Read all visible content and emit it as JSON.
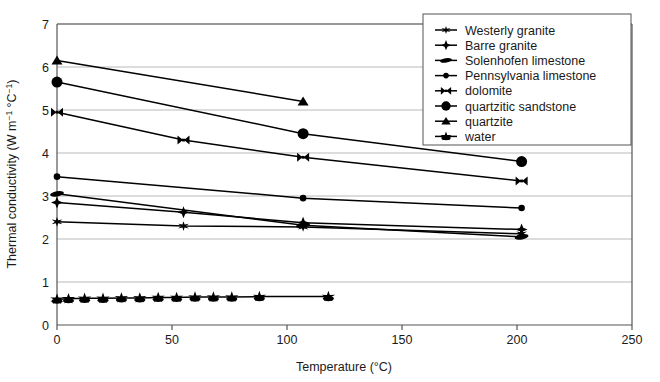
{
  "chart_data": {
    "type": "line",
    "title": "",
    "xlabel": "Temperature (°C)",
    "ylabel": "Thermal conductivity (W m⁻¹ °C⁻¹)",
    "xlim": [
      0,
      250
    ],
    "ylim": [
      0,
      7
    ],
    "xticks": [
      0,
      50,
      100,
      150,
      200,
      250
    ],
    "yticks": [
      0,
      1,
      2,
      3,
      4,
      5,
      6,
      7
    ],
    "grid": "horizontal",
    "legend_position": "top-right",
    "series": [
      {
        "name": "Westerly granite",
        "marker": "star6",
        "color": "#000000",
        "points": [
          [
            0,
            2.4
          ],
          [
            55,
            2.3
          ],
          [
            107,
            2.28
          ],
          [
            202,
            2.12
          ]
        ]
      },
      {
        "name": "Barre granite",
        "marker": "plus-star",
        "color": "#000000",
        "points": [
          [
            0,
            2.85
          ],
          [
            55,
            2.62
          ],
          [
            107,
            2.38
          ],
          [
            202,
            2.22
          ]
        ]
      },
      {
        "name": "Solenhofen limestone",
        "marker": "flat-ellipse",
        "color": "#000000",
        "points": [
          [
            0,
            3.05
          ],
          [
            107,
            2.32
          ],
          [
            202,
            2.05
          ]
        ]
      },
      {
        "name": "Pennsylvania limestone",
        "marker": "small-circle",
        "color": "#000000",
        "points": [
          [
            0,
            3.45
          ],
          [
            107,
            2.95
          ],
          [
            202,
            2.72
          ]
        ]
      },
      {
        "name": "dolomite",
        "marker": "bowtie",
        "color": "#000000",
        "points": [
          [
            0,
            4.95
          ],
          [
            55,
            4.3
          ],
          [
            107,
            3.9
          ],
          [
            202,
            3.35
          ]
        ]
      },
      {
        "name": "quartzitic sandstone",
        "marker": "large-circle",
        "color": "#000000",
        "points": [
          [
            0,
            5.65
          ],
          [
            107,
            4.45
          ],
          [
            202,
            3.8
          ]
        ]
      },
      {
        "name": "quartzite",
        "marker": "triangle",
        "color": "#000000",
        "points": [
          [
            0,
            6.15
          ],
          [
            107,
            5.2
          ]
        ]
      },
      {
        "name": "water",
        "marker": "burst",
        "color": "#000000",
        "points": [
          [
            0,
            0.6
          ],
          [
            5,
            0.61
          ],
          [
            12,
            0.62
          ],
          [
            20,
            0.62
          ],
          [
            28,
            0.63
          ],
          [
            36,
            0.63
          ],
          [
            44,
            0.64
          ],
          [
            52,
            0.64
          ],
          [
            60,
            0.65
          ],
          [
            68,
            0.65
          ],
          [
            76,
            0.65
          ],
          [
            88,
            0.66
          ],
          [
            118,
            0.66
          ]
        ]
      }
    ]
  },
  "axis": {
    "x_tick_labels": [
      "0",
      "50",
      "100",
      "150",
      "200",
      "250"
    ],
    "y_tick_labels": [
      "0",
      "1",
      "2",
      "3",
      "4",
      "5",
      "6",
      "7"
    ],
    "x_title": "Temperature (°C)",
    "y_title_main": "Thermal conductivity (W m",
    "y_title_sup1": "−1",
    "y_title_mid": " °C",
    "y_title_sup2": "−1",
    "y_title_end": ")"
  },
  "legend": {
    "items": [
      {
        "label": "Westerly granite"
      },
      {
        "label": "Barre granite"
      },
      {
        "label": "Solenhofen limestone"
      },
      {
        "label": "Pennsylvania limestone"
      },
      {
        "label": "dolomite"
      },
      {
        "label": "quartzitic sandstone"
      },
      {
        "label": "quartzite"
      },
      {
        "label": "water"
      }
    ]
  },
  "colors": {
    "ink": "#000000",
    "grid": "#b9b9b9",
    "axis": "#555555",
    "background": "#ffffff"
  }
}
